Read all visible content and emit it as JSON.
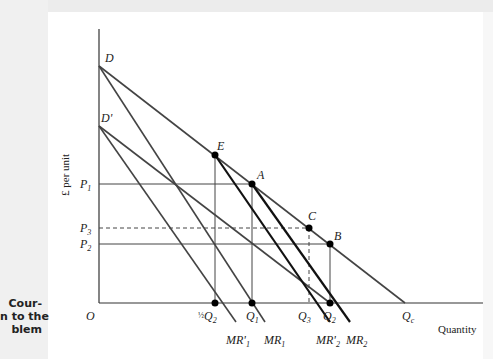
{
  "caption": {
    "lines": [
      "Cour-",
      "n to the",
      "blem"
    ]
  },
  "axes": {
    "y_label": "£ per unit",
    "x_label": "Quantity",
    "origin": "O"
  },
  "price_labels": {
    "p1": "P",
    "p1_sub": "1",
    "p3": "P",
    "p3_sub": "3",
    "p2": "P",
    "p2_sub": "2"
  },
  "quantity_labels": {
    "half_q2_frac": "1/2",
    "half_q2": "Q",
    "half_q2_sub": "2",
    "q1": "Q",
    "q1_sub": "1",
    "q3": "Q",
    "q3_sub": "3",
    "q2": "Q",
    "q2_sub": "2",
    "qc": "Q",
    "qc_sub": "c"
  },
  "curve_labels": {
    "d": "D",
    "d_prime": "D'",
    "mr_prime_1": "MR'",
    "mr_prime_1_sub": "1",
    "mr_1": "MR",
    "mr_1_sub": "1",
    "mr_prime_2": "MR'",
    "mr_prime_2_sub": "2",
    "mr_2": "MR",
    "mr_2_sub": "2"
  },
  "points": {
    "e": "E",
    "a": "A",
    "c": "C",
    "b": "B"
  },
  "colors": {
    "axis": "#333333",
    "curve_gray": "#444444",
    "curve_thick": "#111111",
    "point": "#000000"
  }
}
